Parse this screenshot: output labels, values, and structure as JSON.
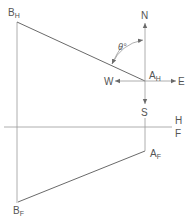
{
  "diagram": {
    "type": "orthographic-projection",
    "colors": {
      "line": "#6a6a6a",
      "reference_line": "#9a9a9a",
      "text": "#555555",
      "background": "#ffffff"
    },
    "points": {
      "B_H": {
        "label": "B",
        "subscript": "H"
      },
      "A_H": {
        "label": "A",
        "subscript": "H"
      },
      "A_F": {
        "label": "A",
        "subscript": "F"
      },
      "B_F": {
        "label": "B",
        "subscript": "F"
      }
    },
    "compass": {
      "north": "N",
      "south": "S",
      "east": "E",
      "west": "W"
    },
    "folding_line": {
      "top_label": "H",
      "bottom_label": "F"
    },
    "angle": {
      "label": "θ°"
    },
    "edges": [
      {
        "from": "B_H",
        "to": "A_H"
      },
      {
        "from": "B_F",
        "to": "A_F"
      },
      {
        "from": "B_H",
        "to": "B_F",
        "kind": "projector"
      },
      {
        "from": "A_H",
        "to": "A_F",
        "kind": "projector"
      }
    ]
  }
}
